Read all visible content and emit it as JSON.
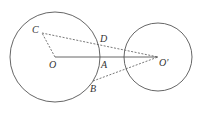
{
  "diagram": {
    "labels": {
      "C": "C",
      "D": "D",
      "O": "O",
      "A": "A",
      "O_prime": "O′",
      "B": "B"
    },
    "circles": [
      {
        "name": "circle-o",
        "cx": 55,
        "cy": 57,
        "r": 45
      },
      {
        "name": "circle-o-prime",
        "cx": 158,
        "cy": 57,
        "r": 34
      }
    ],
    "stroke_color": "#555555"
  }
}
